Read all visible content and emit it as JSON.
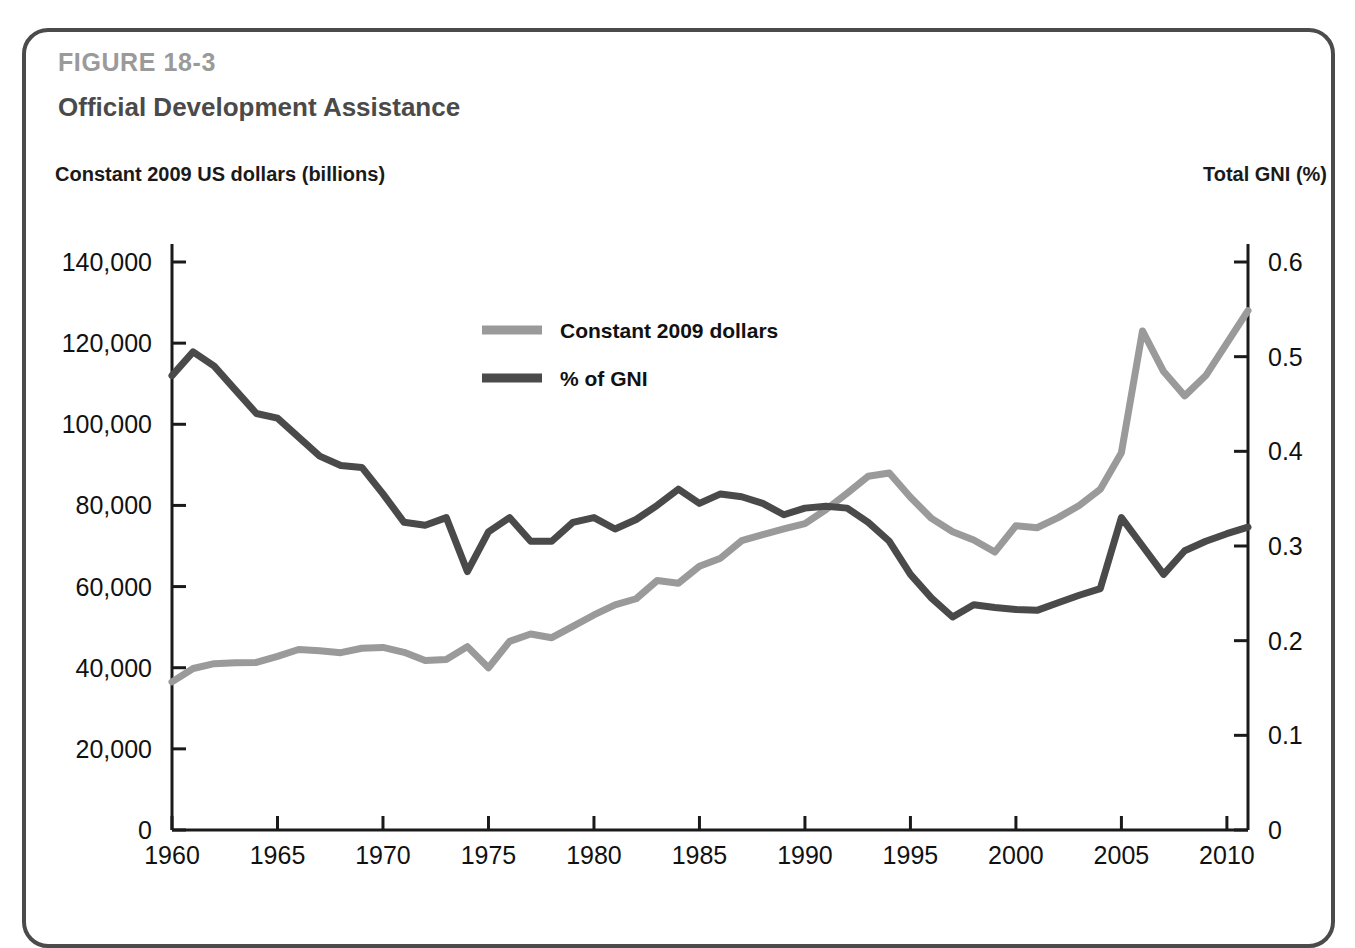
{
  "figure": {
    "number": "FIGURE 18-3",
    "title": "Official Development Assistance",
    "left_axis_caption": "Constant 2009 US dollars (billions)",
    "right_axis_caption": "Total GNI (%)"
  },
  "colors": {
    "dollars_line": "#9a9a9a",
    "gni_line": "#4a4a4a",
    "frame": "#4b4b4b",
    "figure_number": "#9a9a9a",
    "title": "#4a4a4a",
    "axis": "#1a1a1a"
  },
  "chart_data": {
    "type": "line",
    "title": "Official Development Assistance",
    "xlabel": "",
    "ylabel": "Constant 2009 US dollars (billions)",
    "y2label": "Total GNI (%)",
    "xlim": [
      1960,
      2011
    ],
    "ylim": [
      0,
      140000
    ],
    "y2lim": [
      0,
      0.6
    ],
    "grid": false,
    "legend_position": "upper-center-left",
    "x_ticks": [
      "1960",
      "1965",
      "1970",
      "1975",
      "1980",
      "1985",
      "1990",
      "1995",
      "2000",
      "2005",
      "2010"
    ],
    "x_tick_values": [
      1960,
      1965,
      1970,
      1975,
      1980,
      1985,
      1990,
      1995,
      2000,
      2005,
      2010
    ],
    "y_ticks": [
      "0",
      "20,000",
      "40,000",
      "60,000",
      "80,000",
      "100,000",
      "120,000",
      "140,000"
    ],
    "y_tick_values": [
      0,
      20000,
      40000,
      60000,
      80000,
      100000,
      120000,
      140000
    ],
    "y2_ticks": [
      "0",
      "0.1",
      "0.2",
      "0.3",
      "0.4",
      "0.5",
      "0.6"
    ],
    "y2_tick_values": [
      0,
      0.1,
      0.2,
      0.3,
      0.4,
      0.5,
      0.6
    ],
    "x": [
      1960,
      1961,
      1962,
      1963,
      1964,
      1965,
      1966,
      1967,
      1968,
      1969,
      1970,
      1971,
      1972,
      1973,
      1974,
      1975,
      1976,
      1977,
      1978,
      1979,
      1980,
      1981,
      1982,
      1983,
      1984,
      1985,
      1986,
      1987,
      1988,
      1989,
      1990,
      1991,
      1992,
      1993,
      1994,
      1995,
      1996,
      1997,
      1998,
      1999,
      2000,
      2001,
      2002,
      2003,
      2004,
      2005,
      2006,
      2007,
      2008,
      2009,
      2010,
      2011
    ],
    "series": [
      {
        "name": "Constant 2009 dollars",
        "axis": "left",
        "color": "#9a9a9a",
        "values": [
          36500,
          39800,
          41000,
          41200,
          41300,
          42800,
          44500,
          44200,
          43700,
          44800,
          45000,
          43800,
          41800,
          42000,
          45200,
          40000,
          46500,
          48300,
          47400,
          50200,
          53000,
          55500,
          57000,
          61500,
          60800,
          65000,
          67000,
          71300,
          72800,
          74200,
          75500,
          79000,
          83000,
          87200,
          88000,
          82000,
          76800,
          73500,
          71500,
          68500,
          75000,
          74500,
          77000,
          80000,
          84000,
          93000,
          123000,
          113000,
          107000,
          112000,
          120000,
          128000
        ]
      },
      {
        "name": "% of GNI",
        "axis": "right",
        "color": "#4a4a4a",
        "values": [
          0.48,
          0.505,
          0.49,
          0.465,
          0.44,
          0.435,
          0.415,
          0.395,
          0.385,
          0.383,
          0.355,
          0.325,
          0.322,
          0.33,
          0.273,
          0.315,
          0.33,
          0.305,
          0.305,
          0.325,
          0.33,
          0.318,
          0.328,
          0.343,
          0.36,
          0.345,
          0.355,
          0.352,
          0.345,
          0.333,
          0.34,
          0.342,
          0.34,
          0.325,
          0.305,
          0.27,
          0.245,
          0.225,
          0.238,
          0.235,
          0.233,
          0.232,
          0.24,
          0.248,
          0.255,
          0.33,
          0.3,
          0.27,
          0.295,
          0.305,
          0.313,
          0.32
        ]
      }
    ],
    "legend": [
      {
        "label": "Constant 2009 dollars",
        "color": "#9a9a9a"
      },
      {
        "label": "% of GNI",
        "color": "#4a4a4a"
      }
    ]
  }
}
